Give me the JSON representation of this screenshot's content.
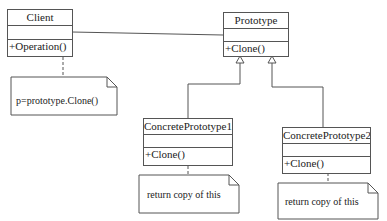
{
  "diagram": {
    "type": "UML class diagram",
    "pattern": "Prototype",
    "classes": [
      {
        "id": "client",
        "name": "Client",
        "attributes": [],
        "operations": [
          "+Operation()"
        ]
      },
      {
        "id": "prototype",
        "name": "Prototype",
        "attributes": [],
        "operations": [
          "+Clone()"
        ]
      },
      {
        "id": "concrete1",
        "name": "ConcretePrototype1",
        "attributes": [],
        "operations": [
          "+Clone()"
        ]
      },
      {
        "id": "concrete2",
        "name": "ConcretePrototype2",
        "attributes": [],
        "operations": [
          "+Clone()"
        ]
      }
    ],
    "notes": [
      {
        "id": "note-client",
        "text": "p=prototype.Clone()",
        "attached_to": "client"
      },
      {
        "id": "note-concrete1",
        "text": "return copy of this",
        "attached_to": "concrete1"
      },
      {
        "id": "note-concrete2",
        "text": "return copy of this",
        "attached_to": "concrete2"
      }
    ],
    "relationships": [
      {
        "type": "association",
        "from": "client",
        "to": "prototype"
      },
      {
        "type": "generalization",
        "from": "concrete1",
        "to": "prototype"
      },
      {
        "type": "generalization",
        "from": "concrete2",
        "to": "prototype"
      }
    ],
    "colors": {
      "line": "#555555",
      "background": "#ffffff",
      "text": "#222222"
    }
  }
}
